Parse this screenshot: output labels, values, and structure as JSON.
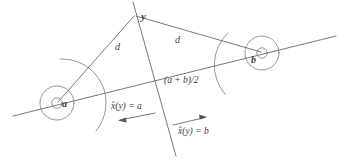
{
  "figure": {
    "colors": {
      "stroke": "#555555",
      "stroke_light": "#6a6a6a",
      "text": "#3a3a3a",
      "background": "#ffffff"
    },
    "labels": {
      "point_y": "y",
      "distance_left": "d",
      "distance_right": "d",
      "prototype_a": "a",
      "prototype_b": "b",
      "midpoint": "(a + b)/2",
      "decision_left": "x̂(y) = a",
      "decision_right": "x̂(y) = b"
    },
    "geometry": {
      "point_y": [
        134,
        14
      ],
      "prototype_a": [
        57,
        103
      ],
      "prototype_b": [
        262,
        53
      ],
      "midpoint": [
        160,
        78
      ],
      "baseline_start": [
        13,
        116
      ],
      "baseline_end": [
        336,
        36
      ],
      "bisector_top": [
        133,
        2
      ],
      "bisector_bottom": [
        176,
        156
      ],
      "circle_inner_radius": 5,
      "circle_outer_radius": 17,
      "arrow_left_from": [
        155,
        113
      ],
      "arrow_left_to": [
        118,
        120
      ],
      "arrow_right_from": [
        173,
        125
      ],
      "arrow_right_to": [
        207,
        117
      ]
    }
  }
}
